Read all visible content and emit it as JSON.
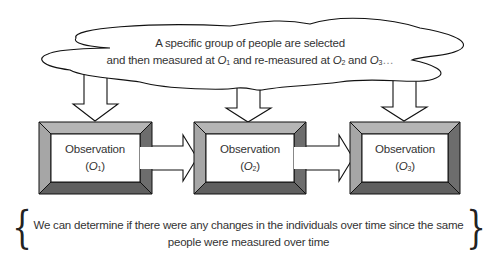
{
  "cloud": {
    "line1": "A specific group of people are selected",
    "line2_prefix": "and then measured at ",
    "o1": "O",
    "o1_sub": "1",
    "line2_mid": " and re-measured at ",
    "o2": "O",
    "o2_sub": "2",
    "line2_and": " and ",
    "o3": "O",
    "o3_sub": "3",
    "line2_suffix": "…"
  },
  "boxes": [
    {
      "title": "Observation",
      "symbol": "O",
      "sub": "1"
    },
    {
      "title": "Observation",
      "symbol": "O",
      "sub": "2"
    },
    {
      "title": "Observation",
      "symbol": "O",
      "sub": "3"
    }
  ],
  "conclusion": {
    "line1": "We can determine if there were any changes in the individuals over time since the same",
    "line2": "people were measured over time",
    "open_brace": "{",
    "close_brace": "}"
  },
  "colors": {
    "frame_light": "#b5b5b5",
    "frame_mid": "#8c8c8c",
    "frame_dark": "#5f5f5f",
    "outline": "#111111"
  }
}
